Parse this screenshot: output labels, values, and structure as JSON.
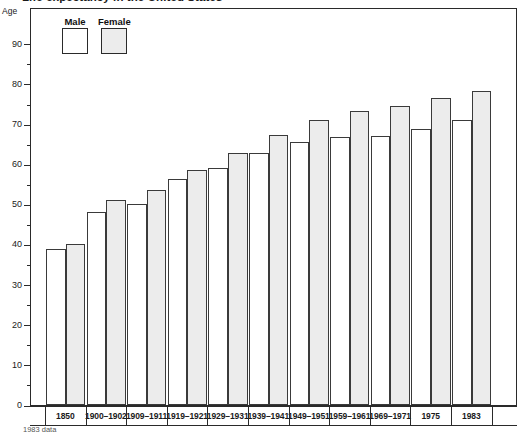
{
  "title": "Life expectancy in the United States",
  "footnote": "1983 data",
  "axis": {
    "y_caption": "Age",
    "y_major_labels": [
      "90",
      "80",
      "70",
      "60",
      "50",
      "40",
      "30",
      "20",
      "10",
      "0"
    ]
  },
  "legend": {
    "items": [
      {
        "label": "Male",
        "color": "#ffffff",
        "name": "legend-male"
      },
      {
        "label": "Female",
        "color": "#ececec",
        "name": "legend-female"
      }
    ]
  },
  "chart_data": {
    "type": "bar",
    "title": "Life expectancy in the United States",
    "xlabel": "",
    "ylabel": "Age",
    "ylim": [
      0,
      95
    ],
    "ytick_step": 10,
    "yminor_step": 5,
    "grid": false,
    "legend_position": "top-left inside plot",
    "categories": [
      "1850",
      "1900–1902",
      "1909–1911",
      "1919–1921",
      "1929–1931",
      "1939–1941",
      "1949–1951",
      "1959–1961",
      "1969–1971",
      "1975",
      "1983"
    ],
    "series": [
      {
        "name": "Male",
        "color": "#ffffff",
        "values": [
          39.0,
          48.2,
          50.2,
          56.3,
          59.1,
          62.8,
          65.5,
          66.8,
          67.0,
          68.7,
          71.0
        ]
      },
      {
        "name": "Female",
        "color": "#ececec",
        "values": [
          40.2,
          51.1,
          53.6,
          58.5,
          62.7,
          67.3,
          71.0,
          73.2,
          74.6,
          76.5,
          78.3
        ]
      }
    ],
    "annotations": [
      "1983 data"
    ]
  }
}
